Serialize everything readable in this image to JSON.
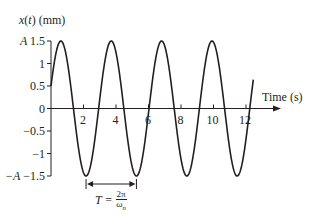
{
  "chart_data": {
    "type": "line",
    "title": "",
    "ylabel": "x(t) (mm)",
    "xlabel": "Time (s)",
    "xlim": [
      0,
      13
    ],
    "ylim": [
      -1.5,
      1.5
    ],
    "grid": false,
    "legend": null,
    "x_ticks": [
      "2",
      "4",
      "6",
      "8",
      "10",
      "12"
    ],
    "y_ticks": [
      "-A -1.5",
      "-1",
      "-0.5",
      "0",
      "0.5",
      "1",
      "A 1.5"
    ],
    "series": [
      {
        "name": "x(t)",
        "function": "1.5*sin(2*pi*t/3.1 + 0.34)",
        "amplitude": 1.5,
        "period": 3.1,
        "x": [
          0,
          0.6,
          1.4,
          2.2,
          3.0,
          3.7,
          4.5,
          5.2,
          6.1,
          6.9,
          7.6,
          8.4,
          9.2,
          10.0,
          10.8,
          11.5,
          12.4
        ],
        "values": [
          0.5,
          1.5,
          0.0,
          -1.5,
          0.0,
          1.5,
          0.0,
          -1.5,
          0.0,
          1.5,
          0.0,
          -1.5,
          0.0,
          1.5,
          0.0,
          -1.5,
          0.5
        ]
      }
    ],
    "annotations": [
      {
        "text": "A",
        "position": "y-axis at 1.5"
      },
      {
        "text": "-A",
        "position": "y-axis at -1.5"
      },
      {
        "text": "T = 2π/ωn",
        "position": "double arrow between troughs at t≈2.2 and t≈5.2"
      }
    ]
  },
  "labels": {
    "ylabel_x": "x",
    "ylabel_t": "t",
    "ylabel_rest": " (mm)",
    "xlabel": "Time (s)",
    "y_ticks": [
      {
        "label": "A 1.5",
        "value": 1.5
      },
      {
        "label": "1",
        "value": 1
      },
      {
        "label": "0.5",
        "value": 0.5
      },
      {
        "label": "0",
        "value": 0
      },
      {
        "label": "−0.5",
        "value": -0.5
      },
      {
        "label": "−1",
        "value": -1
      },
      {
        "label": "−A −1.5",
        "value": -1.5
      }
    ],
    "x_ticks": [
      "2",
      "4",
      "6",
      "8",
      "10",
      "12"
    ],
    "period_T": "T =",
    "period_num": "2π",
    "period_den": "ω",
    "period_den_sub": "n"
  },
  "colors": {
    "line": "#231f20",
    "axis": "#231f20",
    "background": "#ffffff"
  }
}
